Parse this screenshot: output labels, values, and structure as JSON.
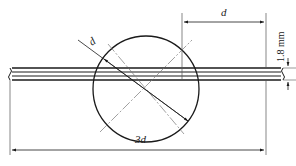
{
  "diagram": {
    "type": "technical-drawing",
    "labels": {
      "circle_diameter": "d",
      "top_dimension": "d",
      "thickness": "1.8 mm",
      "overall_length": "3d"
    },
    "colors": {
      "line": "#1a1a1a",
      "thin": "#555555",
      "center_line": "#777777",
      "background": "#ffffff"
    }
  }
}
